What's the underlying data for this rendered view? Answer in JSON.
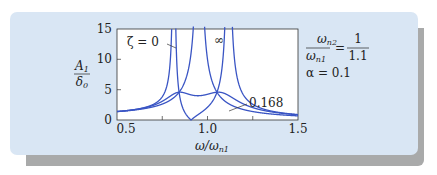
{
  "chart_data": {
    "type": "line",
    "title": "",
    "xlabel": "ω/ω_n1",
    "ylabel": "A1/δ0",
    "xlim": [
      0.5,
      1.5
    ],
    "ylim": [
      0,
      15
    ],
    "xticks": [
      "0.5",
      "1.0",
      "1.5"
    ],
    "yticks": [
      "0",
      "5",
      "10",
      "15"
    ],
    "grid": false,
    "params": {
      "f": 0.9090909,
      "mu": 0.1
    },
    "series": [
      {
        "name": "ζ = 0",
        "zeta": 0,
        "label": "ζ = 0"
      },
      {
        "name": "ζ = 0.168",
        "zeta": 0.168,
        "label": "0.168"
      },
      {
        "name": "ζ = ∞",
        "zeta": 1000,
        "label": "∞"
      }
    ],
    "annotations": {
      "ratio_label_num": "ω_n2",
      "ratio_label_den": "ω_n1",
      "ratio_value_num": "1",
      "ratio_value_den": "1.1",
      "alpha_label": "α = 0.1"
    },
    "key_points": [
      {
        "x": 0.5,
        "y_all": 1.3
      },
      {
        "x": 0.82,
        "y": 4.7,
        "note": "fixed point P"
      },
      {
        "x": 1.07,
        "y": 4.7,
        "note": "fixed point Q"
      },
      {
        "x": 0.909,
        "y": 0,
        "note": "ζ=0 anti-resonance"
      }
    ]
  },
  "labels": {
    "y_axis_num": "A",
    "y_axis_num_sub": "1",
    "y_axis_den": "δ",
    "y_axis_den_sub": "0",
    "x_axis": "ω/ω",
    "x_axis_sub": "n1",
    "zeta0": "ζ = 0",
    "zeta_inf": "∞",
    "zeta_opt": "0.168",
    "ratio_num": "ω",
    "ratio_num_sub": "n2",
    "ratio_den": "ω",
    "ratio_den_sub": "n1",
    "eq": "=",
    "ratio_val_num": "1",
    "ratio_val_den": "1.1",
    "alpha": "α = 0.1"
  },
  "colors": {
    "curve": "#3a55c4",
    "panel": "#d9e6f4",
    "shadow": "#a9aaaa",
    "axis": "#222222"
  }
}
